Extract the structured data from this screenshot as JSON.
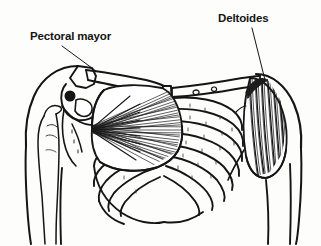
{
  "figure": {
    "view": "anterior",
    "background_color": "#fdfdfc",
    "ink_color": "#151515",
    "muscle_shade_color": "#2a2a2a",
    "labels": [
      {
        "id": "pectoral",
        "text": "Pectoral mayor",
        "icon": "text-label",
        "x": 30,
        "y": 30,
        "leader": {
          "from_x": 62,
          "from_y": 46,
          "to_x": 96,
          "to_y": 71
        },
        "points_to": "pectoralis-major-muscle"
      },
      {
        "id": "deltoides",
        "text": "Deltoides",
        "icon": "text-label",
        "x": 218,
        "y": 12,
        "leader": {
          "from_x": 252,
          "from_y": 28,
          "to_x": 265,
          "to_y": 80
        },
        "points_to": "deltoid-muscle"
      }
    ],
    "structures": [
      {
        "id": "left-shoulder-outline",
        "name": "left-shoulder-contour",
        "label": ""
      },
      {
        "id": "right-shoulder-outline",
        "name": "right-shoulder-contour",
        "label": ""
      },
      {
        "id": "left-clavicle",
        "name": "left-clavicle-bone",
        "label": ""
      },
      {
        "id": "right-clavicle",
        "name": "right-clavicle-bone",
        "label": ""
      },
      {
        "id": "sternum",
        "name": "sternum-bone",
        "label": ""
      },
      {
        "id": "ribcage",
        "name": "ribcage-bones",
        "label": "",
        "rib_pairs": 8
      },
      {
        "id": "left-humerus",
        "name": "left-humerus-bone",
        "label": ""
      },
      {
        "id": "right-humerus",
        "name": "right-humerus-bone",
        "label": ""
      },
      {
        "id": "left-scapula",
        "name": "left-scapula-bone",
        "label": ""
      },
      {
        "id": "pectoralis-major",
        "name": "pectoralis-major-muscle",
        "label": "Pectoral mayor"
      },
      {
        "id": "deltoid",
        "name": "deltoid-muscle",
        "label": "Deltoides"
      }
    ]
  }
}
